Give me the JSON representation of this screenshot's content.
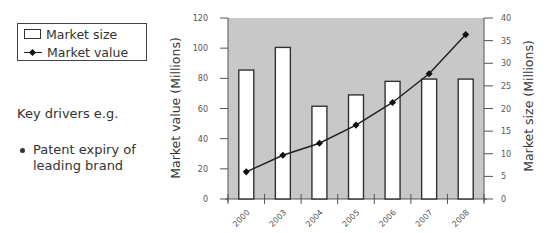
{
  "legend": {
    "items": [
      {
        "label": "Market size",
        "icon": "bar-swatch-icon"
      },
      {
        "label": "Market value",
        "icon": "line-marker-swatch-icon"
      }
    ]
  },
  "sidebar": {
    "title": "Key drivers e.g.",
    "bullets": [
      "Patent expiry of leading brand"
    ]
  },
  "colors": {
    "plot_background": "#c8c8c8",
    "bar_fill": "#ffffff",
    "bar_stroke": "#333333",
    "line": "#222222"
  },
  "chart_data": {
    "type": "bar",
    "title": "",
    "categories": [
      "2000",
      "2003",
      "2004",
      "2005",
      "2006",
      "2007",
      "2008"
    ],
    "series": [
      {
        "name": "Market size",
        "type": "bar",
        "axis": "right",
        "values": [
          28.5,
          33.5,
          20.5,
          23,
          26,
          26.5,
          26.5
        ]
      },
      {
        "name": "Market value",
        "type": "line",
        "axis": "left",
        "values": [
          18,
          29,
          37,
          49,
          64,
          83,
          109
        ]
      }
    ],
    "xlabel": "",
    "ylabel": "Market value (Millions)",
    "ylabel_right": "Market size (Millions)",
    "ylim": [
      0,
      120
    ],
    "ylim_right": [
      0,
      40
    ],
    "yticks": [
      0,
      20,
      40,
      60,
      80,
      100,
      120
    ],
    "yticks_right": [
      0,
      5,
      10,
      15,
      20,
      25,
      30,
      35,
      40
    ],
    "grid": false,
    "legend_position": "top-left, outside plot"
  }
}
